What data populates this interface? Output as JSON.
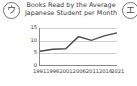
{
  "badges": {
    "left": {
      "icon": "circled-katakana-u-icon",
      "glyph": "ウ"
    },
    "right": {
      "icon": "circled-katakana-e-icon",
      "glyph": "エ"
    }
  },
  "chart_data": {
    "type": "line",
    "title": "Books Read by the Average Japanese Student per Month",
    "title_line1": "Books Read by the Average",
    "title_line2": "Japanese Student per Month",
    "xlabel": "",
    "ylabel": "",
    "categories": [
      "1991",
      "1996",
      "2001",
      "2006",
      "2011",
      "2016",
      "2021"
    ],
    "values": [
      5.6,
      6.4,
      6.6,
      11.5,
      10.0,
      11.8,
      13.0
    ],
    "x": [
      1991,
      1996,
      2001,
      2006,
      2011,
      2016,
      2021
    ],
    "xlim": [
      1991,
      2021
    ],
    "ylim": [
      0,
      15
    ],
    "yticks": [
      "0",
      "5",
      "10",
      "15"
    ],
    "ytick_values": [
      0,
      5,
      10,
      15
    ],
    "grid": true,
    "legend": null,
    "line_color": "#4a4a4a"
  }
}
